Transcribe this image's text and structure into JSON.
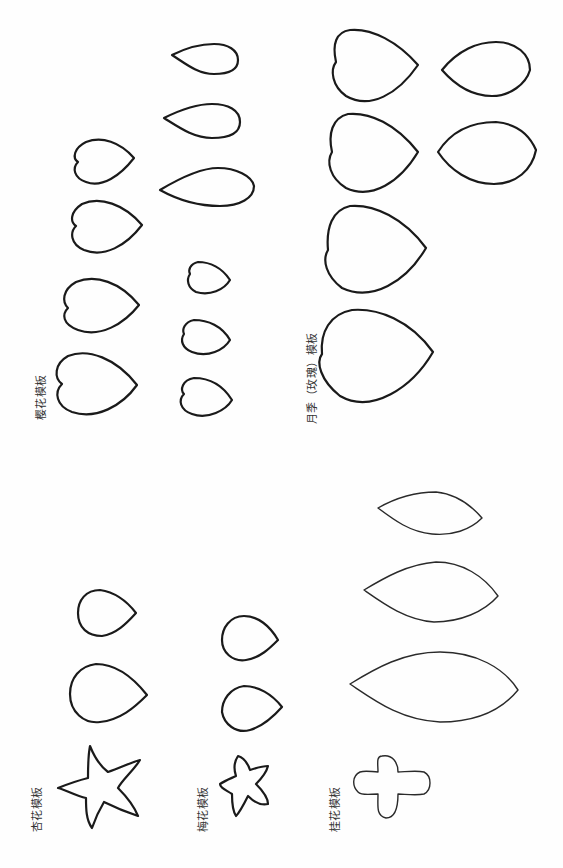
{
  "document": {
    "type": "flower-petal-paper-templates",
    "orientation": "rotated-90-ccw",
    "background": "#fefefe",
    "stroke_color": "#1a1a1a"
  },
  "sections": [
    {
      "id": "cherry",
      "label": "樱花模板",
      "shape_count": 4,
      "shape": "heart-petal"
    },
    {
      "id": "rose",
      "label": "月季（玫瑰）模板",
      "shape_count": 6,
      "shape": "heart-petal and oval"
    },
    {
      "id": "unknown-small",
      "label": "",
      "shape_count": 6,
      "shape": "teardrop and small petal"
    },
    {
      "id": "apricot",
      "label": "杏花模板",
      "shape_count": 3,
      "shape": "star and teardrop"
    },
    {
      "id": "plum",
      "label": "梅花模板",
      "shape_count": 3,
      "shape": "star and teardrop"
    },
    {
      "id": "osmanthus",
      "label": "桂花模板",
      "shape_count": 4,
      "shape": "cross and leaf"
    }
  ]
}
